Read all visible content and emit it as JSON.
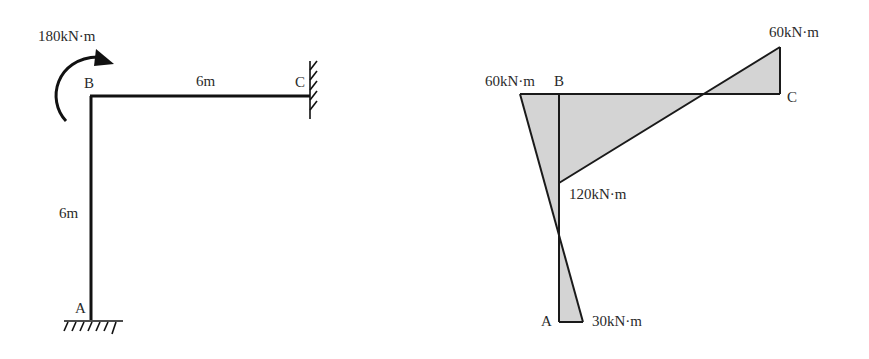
{
  "frame_diagram": {
    "applied_moment": "180kN·m",
    "beam_length": "6m",
    "column_height": "6m",
    "node_a": "A",
    "node_b": "B",
    "node_c": "C"
  },
  "moment_diagram": {
    "moment_b_beam": "60kN·m",
    "node_b": "B",
    "moment_c": "60kN·m",
    "node_c": "C",
    "moment_b_column": "120kN·m",
    "node_a": "A",
    "moment_a": "30kN·m",
    "fill_color": "#d4d4d4",
    "line_color": "#1a1a1a"
  }
}
